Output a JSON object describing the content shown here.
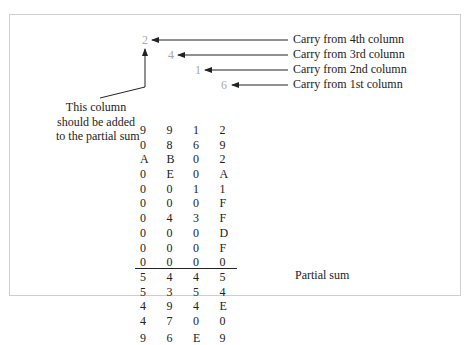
{
  "carries": [
    {
      "digit": "2",
      "label": "Carry from 4th column"
    },
    {
      "digit": "4",
      "label": "Carry from 3rd column"
    },
    {
      "digit": "1",
      "label": "Carry from 2nd column"
    },
    {
      "digit": "6",
      "label": "Carry from 1st column"
    }
  ],
  "note": {
    "line1": "This column",
    "line2": "should be added",
    "line3": "to the partial sum"
  },
  "rows": [
    [
      "9",
      "9",
      "1",
      "2"
    ],
    [
      "0",
      "8",
      "6",
      "9"
    ],
    [
      "A",
      "B",
      "0",
      "2"
    ],
    [
      "0",
      "E",
      "0",
      "A"
    ],
    [
      "0",
      "0",
      "1",
      "1"
    ],
    [
      "0",
      "0",
      "0",
      "F"
    ],
    [
      "0",
      "4",
      "3",
      "F"
    ],
    [
      "0",
      "0",
      "0",
      "D"
    ],
    [
      "0",
      "0",
      "0",
      "F"
    ],
    [
      "0",
      "0",
      "0",
      "0"
    ],
    [
      "5",
      "4",
      "4",
      "5"
    ],
    [
      "5",
      "3",
      "5",
      "4"
    ],
    [
      "4",
      "9",
      "4",
      "E"
    ],
    [
      "4",
      "7",
      "0",
      "0"
    ]
  ],
  "partial_sum": {
    "digits": [
      "9",
      "6",
      "E",
      "9"
    ],
    "label": "Partial sum"
  },
  "colors": {
    "carry_digit": "#a8a8a8",
    "text": "#222222",
    "frame": "#cfcfcf"
  }
}
